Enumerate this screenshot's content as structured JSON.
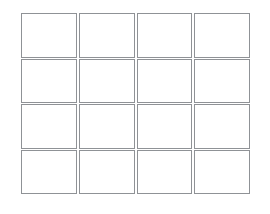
{
  "canvas": {
    "width": 270,
    "height": 214,
    "background_color": "#ffffff"
  },
  "grid": {
    "name": "empty-cell-grid",
    "rows": 4,
    "columns": 4,
    "cell_count": 16,
    "border_color": "#8f9296",
    "cell_background": "#ffffff",
    "cells": [
      {
        "row": 1,
        "column": 1,
        "text": ""
      },
      {
        "row": 1,
        "column": 2,
        "text": ""
      },
      {
        "row": 1,
        "column": 3,
        "text": ""
      },
      {
        "row": 1,
        "column": 4,
        "text": ""
      },
      {
        "row": 2,
        "column": 1,
        "text": ""
      },
      {
        "row": 2,
        "column": 2,
        "text": ""
      },
      {
        "row": 2,
        "column": 3,
        "text": ""
      },
      {
        "row": 2,
        "column": 4,
        "text": ""
      },
      {
        "row": 3,
        "column": 1,
        "text": ""
      },
      {
        "row": 3,
        "column": 2,
        "text": ""
      },
      {
        "row": 3,
        "column": 3,
        "text": ""
      },
      {
        "row": 3,
        "column": 4,
        "text": ""
      },
      {
        "row": 4,
        "column": 1,
        "text": ""
      },
      {
        "row": 4,
        "column": 2,
        "text": ""
      },
      {
        "row": 4,
        "column": 3,
        "text": ""
      },
      {
        "row": 4,
        "column": 4,
        "text": ""
      }
    ]
  }
}
